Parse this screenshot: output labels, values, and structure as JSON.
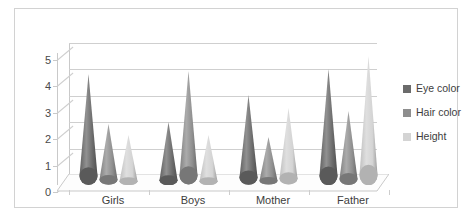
{
  "chart_data": {
    "type": "bar",
    "render_style": "3d-cone-clustered",
    "title": "",
    "subtitle": "",
    "xlabel": "",
    "ylabel": "",
    "categories": [
      "Girls",
      "Boys",
      "Mother",
      "Father"
    ],
    "series": [
      {
        "name": "Eye color",
        "values": [
          4.2,
          2.4,
          3.4,
          4.4
        ],
        "color": "#6b6b6b"
      },
      {
        "name": "Hair color",
        "values": [
          2.3,
          4.3,
          1.8,
          2.8
        ],
        "color": "#8e8e8e"
      },
      {
        "name": "Height",
        "values": [
          1.9,
          1.9,
          2.9,
          4.9
        ],
        "color": "#d4d4d4"
      }
    ],
    "ylim": [
      0,
      5
    ],
    "yticks": [
      "0",
      "1",
      "2",
      "3",
      "4",
      "5"
    ],
    "grid": true,
    "legend_position": "right"
  },
  "legend": {
    "items": [
      {
        "label": "Eye color",
        "swatch": "#6b6b6b"
      },
      {
        "label": "Hair color",
        "swatch": "#8e8e8e"
      },
      {
        "label": "Height",
        "swatch": "#d4d4d4"
      }
    ]
  },
  "colors": {
    "frame": "#d2d2d2",
    "gridline": "#cfcfcf",
    "axis": "#c9c9c9",
    "floor_fill": "#fdfdfd",
    "floor_edge": "#c9c9c9",
    "tick_text": "#4a4a4a",
    "label_text": "#3d3d3d",
    "background": "#ffffff"
  }
}
